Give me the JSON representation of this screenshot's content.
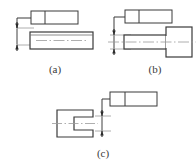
{
  "figure": {
    "background_color": "#ffffff",
    "line_color": "#3a3a3a",
    "centerline_color": "#8c8c8c",
    "width": 196,
    "height": 167,
    "subfigures": [
      {
        "id": "a",
        "caption": "(a)",
        "frame": {
          "name": "feature-control-frame",
          "compartments": 2,
          "compartment_labels": [
            "",
            ""
          ],
          "x": 31,
          "y": 11,
          "width": 47,
          "height": 13,
          "divider_x": 45
        },
        "leader": {
          "name": "leader-line",
          "points": "31,18 17,18 17,28"
        },
        "dimension": {
          "name": "tolerance-zone-dimension",
          "arrow_top_y": 28,
          "arrow_bottom_y": 45,
          "axis_x": 17,
          "extension_line_top": "17,28 33,28",
          "extension_line_bottom": "17,45 33,45",
          "arrowheads": 2
        },
        "part": {
          "name": "shaft-rectangle",
          "x": 30,
          "y": 32,
          "width": 63,
          "height": 17,
          "centerline": "36,40.5 88,40.5",
          "inner_top_edge": "30,35 93,35"
        }
      },
      {
        "id": "b",
        "caption": "(b)",
        "frame": {
          "name": "feature-control-frame",
          "compartments": 2,
          "compartment_labels": [
            "",
            ""
          ],
          "x": 125,
          "y": 10,
          "width": 47,
          "height": 13,
          "divider_x": 139
        },
        "leader": {
          "name": "leader-line",
          "points": "125,17 114,17 114,31"
        },
        "dimension": {
          "name": "tolerance-zone-dimension",
          "arrow_top_y": 31,
          "arrow_bottom_y": 53,
          "axis_x": 114,
          "extension_line_top": "110,35 130,35",
          "extension_line_bottom": "110,49 130,49",
          "arrowheads": 2
        },
        "part": {
          "name": "stepped-shaft-with-head",
          "shaft": {
            "x": 124,
            "y": 35,
            "width": 44,
            "height": 14
          },
          "head": {
            "x": 166,
            "y": 27,
            "width": 26,
            "height": 30
          },
          "centerline": "108,42 196,42"
        }
      },
      {
        "id": "c",
        "caption": "(c)",
        "frame": {
          "name": "feature-control-frame",
          "compartments": 2,
          "compartment_labels": [
            "",
            ""
          ],
          "x": 110,
          "y": 92,
          "width": 47,
          "height": 14,
          "divider_x": 125
        },
        "leader": {
          "name": "leader-line",
          "points": "110,99 102,99 102,112"
        },
        "dimension": {
          "name": "tolerance-zone-dimension",
          "arrow_top_y": 112,
          "arrow_bottom_y": 135,
          "axis_x": 102,
          "extension_line_top": "95,116 110,116",
          "extension_line_bottom": "95,131 110,131",
          "arrowheads": 2
        },
        "part": {
          "name": "slotted-block",
          "outline": "57,110 93,110 93,117 74,117 74,130 93,130 93,137 57,137",
          "slot_depth": 19,
          "centerline": "52,123.5 98,123.5"
        }
      }
    ]
  }
}
